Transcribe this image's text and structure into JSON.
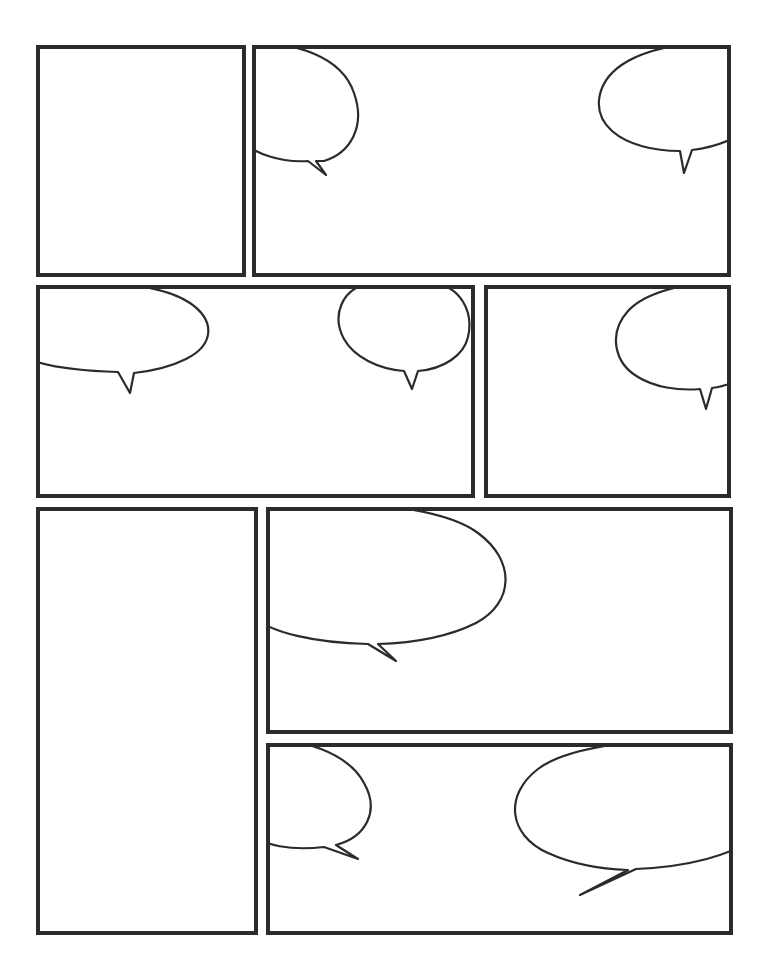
{
  "document": {
    "title": "Comic Page Template",
    "page_width": 766,
    "page_height": 976,
    "background_color": "#ffffff",
    "ink_color": "#2b2b2b",
    "panel_border_width": 4,
    "panel_count": 7,
    "bubble_count": 9,
    "all_panels_empty": true,
    "all_bubbles_empty": true
  },
  "panels": [
    {
      "id": "panel-1",
      "label": "",
      "row": 1,
      "column": 1,
      "x": 36,
      "y": 45,
      "width": 210,
      "height": 232,
      "bubbles": []
    },
    {
      "id": "panel-2",
      "label": "",
      "row": 1,
      "column": 2,
      "x": 252,
      "y": 45,
      "width": 479,
      "height": 232,
      "bubbles": [
        {
          "id": "bubble-2a",
          "label": "",
          "tail_direction": "down-left"
        },
        {
          "id": "bubble-2b",
          "label": "",
          "tail_direction": "down"
        }
      ]
    },
    {
      "id": "panel-3",
      "label": "",
      "row": 2,
      "column": 1,
      "x": 36,
      "y": 285,
      "width": 439,
      "height": 213,
      "bubbles": [
        {
          "id": "bubble-3a",
          "label": "",
          "tail_direction": "down"
        },
        {
          "id": "bubble-3b",
          "label": "",
          "tail_direction": "down"
        }
      ]
    },
    {
      "id": "panel-4",
      "label": "",
      "row": 2,
      "column": 2,
      "x": 484,
      "y": 285,
      "width": 247,
      "height": 213,
      "bubbles": [
        {
          "id": "bubble-4a",
          "label": "",
          "tail_direction": "down"
        }
      ]
    },
    {
      "id": "panel-5",
      "label": "",
      "row": 3,
      "column": 1,
      "x": 36,
      "y": 507,
      "width": 222,
      "height": 428,
      "bubbles": []
    },
    {
      "id": "panel-6",
      "label": "",
      "row": 3,
      "column": 2,
      "x": 266,
      "y": 507,
      "width": 467,
      "height": 227,
      "bubbles": [
        {
          "id": "bubble-6a",
          "label": "",
          "tail_direction": "down"
        }
      ]
    },
    {
      "id": "panel-7",
      "label": "",
      "row": 4,
      "column": 2,
      "x": 266,
      "y": 743,
      "width": 467,
      "height": 192,
      "bubbles": [
        {
          "id": "bubble-7a",
          "label": "",
          "tail_direction": "down-right"
        },
        {
          "id": "bubble-7b",
          "label": "",
          "tail_direction": "down-left"
        }
      ]
    }
  ]
}
